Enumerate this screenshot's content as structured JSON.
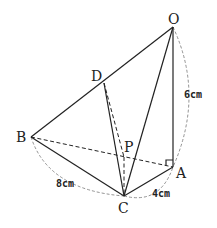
{
  "diagram": {
    "type": "geometry-pyramid",
    "points": {
      "O": {
        "label": "O",
        "x": 173,
        "y": 27
      },
      "D": {
        "label": "D",
        "x": 104,
        "y": 83
      },
      "B": {
        "label": "B",
        "x": 31,
        "y": 137
      },
      "P": {
        "label": "P",
        "x": 124,
        "y": 157
      },
      "A": {
        "label": "A",
        "x": 173,
        "y": 167
      },
      "C": {
        "label": "C",
        "x": 124,
        "y": 196
      }
    },
    "measurements": {
      "OA": "6cm",
      "BC": "8cm",
      "CA": "4cm"
    },
    "right_angle_at": "A"
  }
}
